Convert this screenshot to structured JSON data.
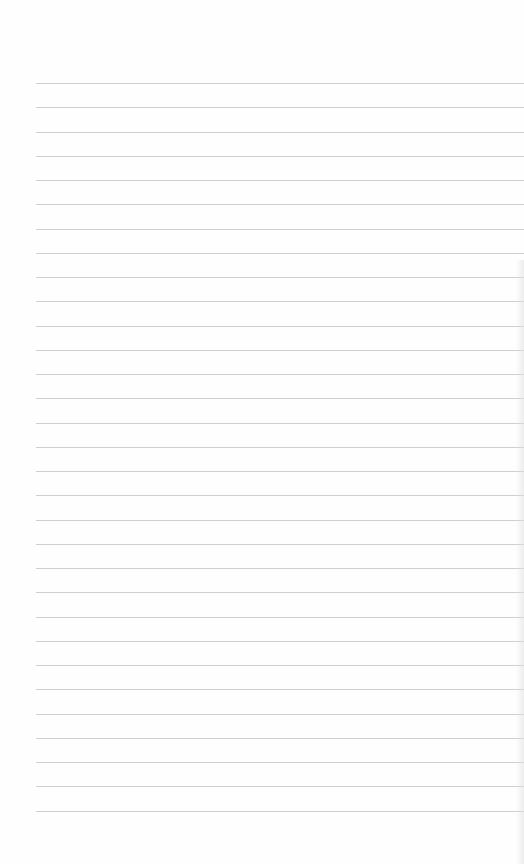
{
  "page": {
    "type": "lined-paper",
    "line_count": 31,
    "line_color": "#cfcfcf",
    "background": "#fefefe",
    "first_line_y": 0,
    "line_spacing": 24.25
  }
}
